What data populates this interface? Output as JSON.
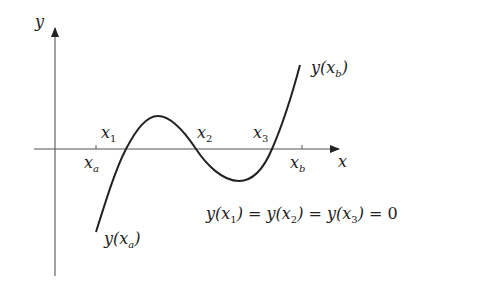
{
  "diagram": {
    "axes": {
      "x_label": "x",
      "y_label": "y"
    },
    "ticks": {
      "xa": {
        "base": "x",
        "sub": "a"
      },
      "xb": {
        "base": "x",
        "sub": "b"
      }
    },
    "roots": [
      {
        "base": "x",
        "sub": "1"
      },
      {
        "base": "x",
        "sub": "2"
      },
      {
        "base": "x",
        "sub": "3"
      }
    ],
    "endpoint_labels": {
      "start": {
        "fn": "y(",
        "base": "x",
        "sub": "a",
        "close": ")"
      },
      "end": {
        "fn": "y(",
        "base": "x",
        "sub": "b",
        "close": ")"
      }
    },
    "equation": {
      "parts": [
        {
          "fn": "y(",
          "base": "x",
          "sub": "1",
          "close": ")"
        },
        {
          "op": " = "
        },
        {
          "fn": "y(",
          "base": "x",
          "sub": "2",
          "close": ")"
        },
        {
          "op": " = "
        },
        {
          "fn": "y(",
          "base": "x",
          "sub": "3",
          "close": ")"
        },
        {
          "op": " = "
        },
        {
          "value": "0"
        }
      ]
    },
    "colors": {
      "axis": "#444444",
      "curve": "#222222",
      "text": "#222222"
    }
  }
}
